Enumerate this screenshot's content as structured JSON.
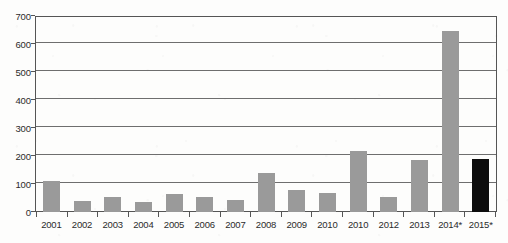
{
  "chart_data": {
    "type": "bar",
    "title": "",
    "subtitle": "",
    "xlabel": "",
    "ylabel": "",
    "categories": [
      "2001",
      "2002",
      "2003",
      "2004",
      "2005",
      "2006",
      "2007",
      "2008",
      "2009",
      "2010",
      "2010",
      "2012",
      "2013",
      "2014*",
      "2015*"
    ],
    "values": [
      112,
      40,
      53,
      35,
      66,
      53,
      43,
      140,
      78,
      67,
      218,
      53,
      187,
      648,
      190
    ],
    "ylim": [
      0,
      700
    ],
    "ytick_labels": [
      "0",
      "100",
      "200",
      "300",
      "400",
      "500",
      "600",
      "700"
    ],
    "ytick_values": [
      0,
      100,
      200,
      300,
      400,
      500,
      600,
      700
    ],
    "grid": true,
    "legend": "none",
    "bar_colors": [
      "#9a9a9a",
      "#9a9a9a",
      "#9a9a9a",
      "#9a9a9a",
      "#9a9a9a",
      "#9a9a9a",
      "#9a9a9a",
      "#9a9a9a",
      "#9a9a9a",
      "#9a9a9a",
      "#9a9a9a",
      "#9a9a9a",
      "#9a9a9a",
      "#9a9a9a",
      "#0d0d0d"
    ],
    "series": [
      {
        "name": "",
        "values": [
          112,
          40,
          53,
          35,
          66,
          53,
          43,
          140,
          78,
          67,
          218,
          53,
          187,
          648,
          190
        ]
      }
    ],
    "annotations": [],
    "colors": {
      "bar_default": "#9a9a9a",
      "bar_highlight": "#0d0d0d",
      "gridline": "#6e6e6e",
      "axis": "#555555",
      "text": "#2b2b2b",
      "background": "#fdfdfc"
    }
  }
}
